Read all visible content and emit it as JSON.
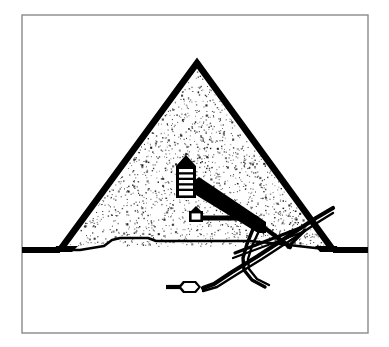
{
  "figure": {
    "kind": "line-diagram",
    "background_color": "#ffffff",
    "ink_color": "#000000",
    "frame_color": "#8a8a8a"
  },
  "frame": {
    "name": "thin rectangular border",
    "x": 22,
    "y": 15,
    "width": 346,
    "height": 318,
    "stroke_width": 1.4,
    "color": "#8a8a8a"
  },
  "ground": {
    "label": "ground line",
    "y": 250,
    "x_start": 22,
    "x_end": 368,
    "stroke_width": 6,
    "color": "#000000"
  },
  "pyramid": {
    "label": "pyramid outline",
    "apex_x": 197,
    "apex_y": 63,
    "base_left_x": 60,
    "base_right_x": 333,
    "base_y": 250,
    "stroke_width": 6.5,
    "fill": "stipple",
    "stipple_color": "#1a1a1a",
    "stipple_density": 1450
  },
  "bedrock": {
    "label": "bedrock outcrop under pyramid",
    "points": "60,250 80,250 104,246 112,240 120,238 148,238 156,241 210,241 250,241 280,244 333,250"
  },
  "chambers": [
    {
      "name": "kings-chamber",
      "label": "King's Chamber with relieving chambers",
      "x": 178,
      "y": 162,
      "width": 16,
      "height": 36,
      "gable_height": 8,
      "relieving_lines": 5
    },
    {
      "name": "queens-chamber",
      "label": "Queen's Chamber",
      "x": 190,
      "y": 210,
      "width": 11,
      "height": 11,
      "gable_height": 5
    },
    {
      "name": "subterranean-chamber",
      "label": "Subterranean Chamber",
      "x": 184,
      "y": 282,
      "width": 14,
      "height": 12
    }
  ],
  "passages": [
    {
      "name": "grand-gallery",
      "label": "Grand Gallery",
      "from": "194,187",
      "to": "258,228",
      "stroke_width": 9
    },
    {
      "name": "ascending-passage",
      "label": "Ascending Passage",
      "from": "258,228",
      "to": "288,247",
      "stroke_width": 4.5
    },
    {
      "name": "horizontal-passage",
      "label": "Horizontal Passage to Queen's Chamber",
      "from": "200,218",
      "to": "253,218",
      "stroke_width": 5
    },
    {
      "name": "descending-passage",
      "label": "Descending Passage from entrance",
      "from": "313,220",
      "to": "210,288",
      "stroke_width": 4
    },
    {
      "name": "entrance-passage",
      "label": "Entrance on north face",
      "from": "333,212",
      "to": "313,220",
      "stroke_width": 4
    },
    {
      "name": "well-shaft",
      "label": "Well Shaft",
      "from": "252,228",
      "to": "210,288",
      "stroke_width": 3.5
    },
    {
      "name": "dead-end-passage",
      "label": "Dead-end passage west of subterranean chamber",
      "from": "168,288",
      "to": "184,288",
      "stroke_width": 3.5
    },
    {
      "name": "air-shaft-upper",
      "label": "Shaft from King's Chamber to exterior",
      "from": "194,184",
      "to": "262,224",
      "stroke_width": 3
    }
  ],
  "annotations": {
    "none_visible": "This figure contains no printed text labels."
  }
}
